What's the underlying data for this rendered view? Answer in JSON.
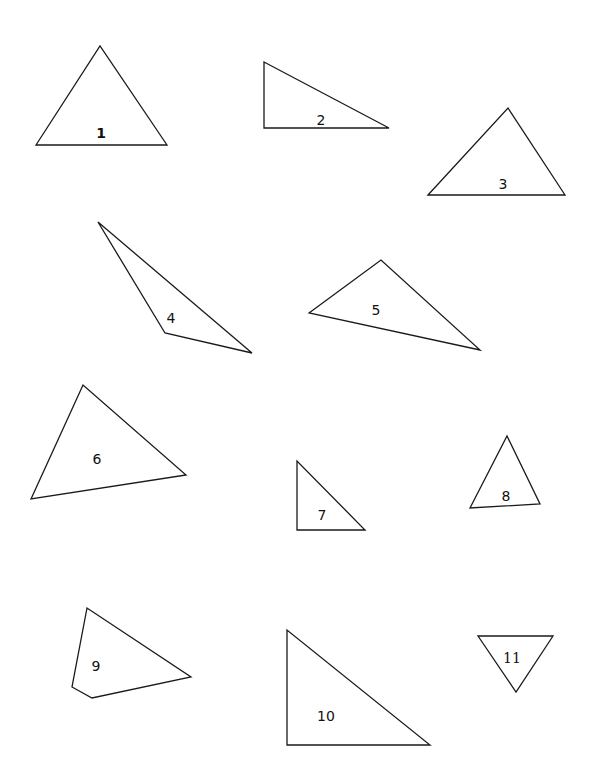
{
  "figure": {
    "title": "",
    "background": "#ffffff",
    "stroke_color": "#1a1a1a",
    "shapes": [
      {
        "id": "1",
        "label": "1",
        "points": [
          [
            36,
            145
          ],
          [
            100,
            46
          ],
          [
            167,
            145
          ]
        ],
        "label_pos": [
          101,
          134
        ],
        "style": "bold"
      },
      {
        "id": "2",
        "label": "2",
        "points": [
          [
            264,
            62
          ],
          [
            264,
            128
          ],
          [
            389,
            128
          ]
        ],
        "label_pos": [
          321,
          121
        ],
        "style": "normal"
      },
      {
        "id": "3",
        "label": "3",
        "points": [
          [
            428,
            195
          ],
          [
            508,
            108
          ],
          [
            565,
            195
          ]
        ],
        "label_pos": [
          503,
          185
        ],
        "style": "normal"
      },
      {
        "id": "4",
        "label": "4",
        "points": [
          [
            98,
            222
          ],
          [
            165,
            333
          ],
          [
            252,
            353
          ]
        ],
        "label_pos": [
          171,
          319
        ],
        "style": "normal"
      },
      {
        "id": "5",
        "label": "5",
        "points": [
          [
            309,
            313
          ],
          [
            381,
            260
          ],
          [
            480,
            350
          ]
        ],
        "label_pos": [
          376,
          311
        ],
        "style": "normal"
      },
      {
        "id": "6",
        "label": "6",
        "points": [
          [
            31,
            499
          ],
          [
            83,
            385
          ],
          [
            186,
            475
          ]
        ],
        "label_pos": [
          97,
          460
        ],
        "style": "normal"
      },
      {
        "id": "7",
        "label": "7",
        "points": [
          [
            297,
            461
          ],
          [
            297,
            530
          ],
          [
            365,
            530
          ]
        ],
        "label_pos": [
          322,
          516
        ],
        "style": "normal"
      },
      {
        "id": "8",
        "label": "8",
        "points": [
          [
            470,
            508
          ],
          [
            507,
            436
          ],
          [
            540,
            504
          ]
        ],
        "label_pos": [
          506,
          497
        ],
        "style": "normal"
      },
      {
        "id": "9",
        "label": "9",
        "points": [
          [
            87,
            608
          ],
          [
            72,
            687
          ],
          [
            92,
            698
          ],
          [
            191,
            677
          ]
        ],
        "label_pos": [
          96,
          667
        ],
        "style": "normal"
      },
      {
        "id": "10",
        "label": "10",
        "points": [
          [
            287,
            630
          ],
          [
            287,
            745
          ],
          [
            430,
            745
          ]
        ],
        "label_pos": [
          326,
          717
        ],
        "style": "normal"
      },
      {
        "id": "11",
        "label": "11",
        "points": [
          [
            478,
            636
          ],
          [
            553,
            636
          ],
          [
            516,
            692
          ]
        ],
        "label_pos": [
          512,
          659
        ],
        "style": "serif"
      }
    ]
  }
}
